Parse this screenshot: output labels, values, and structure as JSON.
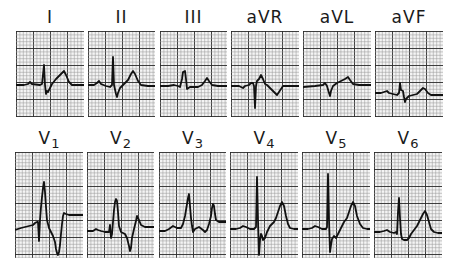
{
  "figure": {
    "grid": {
      "minor_px": 3.4,
      "major_every": 5,
      "minor_color": "#9a9a9a",
      "major_color": "#2a2a2a",
      "background": "#f4f4f4"
    },
    "trace_color": "#111111"
  },
  "rows": [
    {
      "name": "limb-leads",
      "leads": [
        {
          "id": "I",
          "label": "I",
          "sub": "",
          "x": 16,
          "y": 31,
          "w": 68,
          "h": 86,
          "trace": "0,54 8,54 12,53 14,51 16,53 24,54 26,53 28,34 29,54 30,63 31,60 32,61 34,57 36,53 40,48 44,44 46,42 48,40 50,44 53,51 56,54 62,54 68,54"
        },
        {
          "id": "II",
          "label": "II",
          "sub": "",
          "x": 88,
          "y": 31,
          "w": 67,
          "h": 86,
          "trace": "0,54 6,54 9,52 11,50 13,53 18,55 22,56 24,54 25,26 26,54 28,63 29,66 30,62 32,57 36,53 40,49 43,43 45,40 47,43 50,50 53,54 60,55 67,55"
        },
        {
          "id": "III",
          "label": "III",
          "sub": "",
          "x": 160,
          "y": 31,
          "w": 67,
          "h": 86,
          "trace": "0,55 8,55 14,54 18,55 20,56 22,48 23,41 25,40 26,48 27,58 30,56 34,56 38,56 42,54 45,50 47,47 49,50 52,54 58,55 67,55"
        },
        {
          "id": "aVR",
          "label": "aVR",
          "sub": "",
          "x": 231,
          "y": 31,
          "w": 68,
          "h": 86,
          "trace": "0,55 8,55 10,56 12,57 14,55 18,54 20,52 22,52 23,55 24,77 25,55 26,50 28,48 30,44 32,48 34,53 36,54 40,58 44,62 46,64 48,61 52,55 60,55 68,55"
        },
        {
          "id": "aVL",
          "label": "aVL",
          "sub": "",
          "x": 303,
          "y": 31,
          "w": 68,
          "h": 86,
          "trace": "0,56 12,55 20,54 22,52 24,55 26,62 27,65 28,60 30,55 34,52 38,50 42,48 45,46 47,49 50,53 56,54 68,54"
        },
        {
          "id": "aVF",
          "label": "aVF",
          "sub": "",
          "x": 375,
          "y": 31,
          "w": 68,
          "h": 86,
          "trace": "0,62 6,62 9,61 12,60 14,62 18,63 22,64 24,62 25,52 26,59 28,60 29,66 30,71 31,68 34,65 38,64 42,63 45,60 48,57 50,58 53,62 56,64 62,64 68,64"
        }
      ]
    },
    {
      "name": "chest-leads",
      "leads": [
        {
          "id": "V1",
          "label": "V",
          "sub": "1",
          "x": 15,
          "y": 152,
          "w": 68,
          "h": 106,
          "trace": "0,78 6,76 10,75 14,74 18,73 20,71 22,70 23,70 24,89 25,68 26,55 27,45 28,36 29,30 30,40 31,55 32,68 34,76 36,80 38,84 40,90 41,97 42,101 43,103 44,100 45,93 46,82 47,72 48,64 49,61 51,62 54,63 60,63 68,63"
        },
        {
          "id": "V2",
          "label": "V",
          "sub": "2",
          "x": 87,
          "y": 152,
          "w": 67,
          "h": 106,
          "trace": "0,79 6,79 9,77 11,78 14,79 18,80 22,80 23,73 24,86 25,82 26,70 27,58 28,50 29,47 30,49 31,60 32,74 34,80 38,82 40,86 42,94 43,99 44,96 45,86 47,77 49,69 50,64 52,68 54,73 58,75 67,75"
        },
        {
          "id": "V3",
          "label": "V",
          "sub": "3",
          "x": 159,
          "y": 152,
          "w": 67,
          "h": 106,
          "trace": "0,79 6,79 10,77 14,74 18,76 22,76 24,72 26,64 27,58 28,52 29,46 30,42 31,54 32,66 33,74 34,80 36,77 40,75 44,78 46,80 48,78 50,72 52,64 53,56 54,52 55,54 56,62 57,68 60,70 67,70"
        },
        {
          "id": "V4",
          "label": "V",
          "sub": "4",
          "x": 230,
          "y": 152,
          "w": 68,
          "h": 106,
          "trace": "0,77 6,77 10,76 13,74 16,75 20,77 24,77 26,75 27,25 28,68 29,103 30,88 31,82 32,84 33,88 35,86 37,80 40,74 44,70 46,66 48,60 50,54 52,50 54,54 56,64 58,72 60,76 64,77 68,77"
        },
        {
          "id": "V5",
          "label": "V",
          "sub": "5",
          "x": 302,
          "y": 152,
          "w": 68,
          "h": 106,
          "trace": "0,77 6,77 10,76 13,74 16,75 20,77 24,77 25,75 26,22 27,68 28,100 29,93 30,87 32,84 34,86 36,82 39,76 42,70 45,66 47,60 49,54 51,50 53,54 55,64 58,72 61,76 65,77 68,77"
        },
        {
          "id": "V6",
          "label": "V",
          "sub": "6",
          "x": 374,
          "y": 152,
          "w": 68,
          "h": 106,
          "trace": "0,80 6,80 10,79 13,78 16,80 20,81 22,80 23,82 24,60 25,46 26,66 27,82 28,87 30,88 33,88 35,86 37,82 40,78 43,74 45,70 47,66 49,62 51,59 53,63 55,70 57,77 60,80 64,81 68,81"
        }
      ]
    }
  ]
}
